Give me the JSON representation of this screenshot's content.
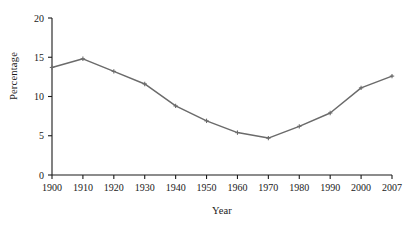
{
  "chart_data": {
    "type": "line",
    "title": "",
    "xlabel": "Year",
    "ylabel": "Percentage",
    "categories": [
      "1900",
      "1910",
      "1920",
      "1930",
      "1940",
      "1950",
      "1960",
      "1970",
      "1980",
      "1990",
      "2000",
      "2007"
    ],
    "values": [
      13.7,
      14.8,
      13.2,
      11.6,
      8.8,
      6.9,
      5.4,
      4.7,
      6.2,
      7.9,
      11.1,
      12.6
    ],
    "x": [
      1900,
      1910,
      1920,
      1930,
      1940,
      1950,
      1960,
      1970,
      1980,
      1990,
      2000,
      2007
    ],
    "ylim": [
      0,
      20
    ],
    "y_ticks": [
      0,
      5,
      10,
      15,
      20
    ],
    "y_tick_labels": [
      "0",
      "5",
      "10",
      "15",
      "20"
    ],
    "x_tick_labels": [
      "1900",
      "1910",
      "1920",
      "1930",
      "1940",
      "1950",
      "1960",
      "1970",
      "1980",
      "1990",
      "2000",
      "2007"
    ],
    "grid": false,
    "legend": false,
    "legend_position": "none",
    "series": [
      {
        "name": "Percentage",
        "color": "#6b6b6b",
        "marker": "cross",
        "values": [
          13.7,
          14.8,
          13.2,
          11.6,
          8.8,
          6.9,
          5.4,
          4.7,
          6.2,
          7.9,
          11.1,
          12.6
        ]
      }
    ],
    "colors": {
      "line": "#6b6b6b",
      "axis": "#1a1a1a",
      "background": "#ffffff",
      "text": "#1a1a1a"
    }
  }
}
